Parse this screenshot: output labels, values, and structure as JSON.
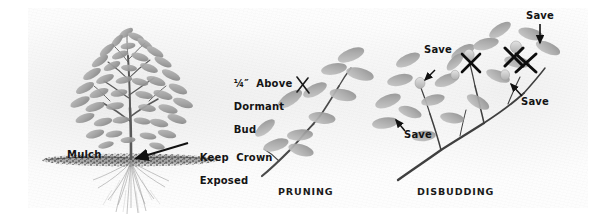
{
  "illustration": {
    "title": "Shrub planting, pruning and disbudding diagram",
    "medium": "pencil-sketch",
    "background_color": "#ffffff",
    "paper_tint": "#ededed",
    "ink_color": "#141414"
  },
  "panels": [
    {
      "id": "planting",
      "caption": "",
      "labels": [
        {
          "name": "mulch-label",
          "text": "Mulch"
        },
        {
          "name": "keep-crown-exposed-label",
          "text": "Keep  Crown\nExposed"
        }
      ]
    },
    {
      "id": "pruning",
      "caption": "PRUNING",
      "labels": [
        {
          "name": "quarter-inch-above-dormant-bud-label",
          "text": "¼″  Above\nDormant\nBud"
        }
      ]
    },
    {
      "id": "disbudding",
      "caption": "DISBUDDING",
      "labels": [
        {
          "name": "save-label-left",
          "text": "Save"
        },
        {
          "name": "save-label-top",
          "text": "Save"
        },
        {
          "name": "save-label-lower",
          "text": "Save"
        },
        {
          "name": "save-label-right",
          "text": "Save"
        }
      ]
    }
  ],
  "captions": {
    "pruning": "PRUNING",
    "disbudding": "DISBUDDING"
  },
  "labels": {
    "mulch": "Mulch",
    "keep_crown_line1": "Keep  Crown",
    "keep_crown_line2": "Exposed",
    "bud_line1": "¼″  Above",
    "bud_line2": "Dormant",
    "bud_line3": "Bud",
    "save": "Save"
  },
  "markers": {
    "x_mark_count": 4,
    "arrow_count": 5,
    "x_mark_color": "#111111"
  }
}
